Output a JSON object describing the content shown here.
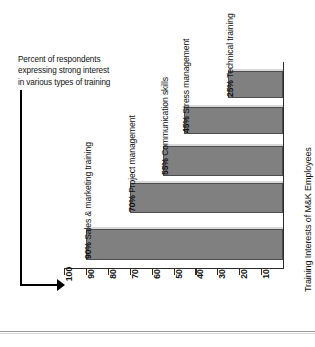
{
  "chart_data": {
    "type": "bar",
    "orientation": "horizontal-rotated",
    "title": "Training Interests of M&K Employees",
    "categories": [
      "Sales & marketing training",
      "Project management",
      "Communication skills",
      "Stress management",
      "Technical training"
    ],
    "values": [
      90,
      70,
      55,
      45,
      25
    ],
    "value_labels": [
      "90%",
      "70%",
      "55%",
      "45%",
      "25%"
    ],
    "bar_labels": [
      "90% Sales & marketing training",
      "70% Project management",
      "55% Communication skills",
      "45% Stress management",
      "25% Technical training"
    ],
    "xlabel": "",
    "ylabel": "",
    "axis_ticks": [
      "100",
      "90",
      "80",
      "70",
      "60",
      "50",
      "40",
      "30",
      "20",
      "10"
    ],
    "axis_range": [
      100,
      10
    ],
    "axis_direction": "descending-left-to-right",
    "grid": false,
    "legend": "none",
    "bar_color": "#808080",
    "bar_border_color": "#4d4d4d",
    "bar_highlight_color": "#d8d8d8",
    "axis_color": "#2b2b2b",
    "text_color": "#111111"
  },
  "annotation": {
    "line1": "Percent of respondents",
    "line2": "expressing strong interest",
    "line3": "in various types of training",
    "arrow": "arrow-pointing-right"
  }
}
